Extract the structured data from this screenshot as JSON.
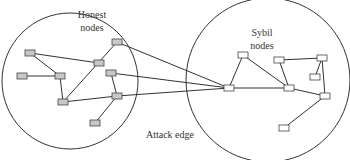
{
  "labels": {
    "honest_line1": "Honest",
    "honest_line2": "nodes",
    "sybil_line1": "Sybil",
    "sybil_line2": "nodes",
    "attack_edge": "Attack edge"
  },
  "colors": {
    "line": "#333333",
    "honest_node_fill": "#c8c8c8",
    "sybil_node_fill": "#ffffff"
  },
  "regions": {
    "honest": {
      "cx": 70,
      "cy": 81,
      "r": 68
    },
    "sybil": {
      "cx": 268,
      "cy": 80,
      "r": 82
    }
  },
  "honest_nodes": [
    {
      "id": "h1",
      "x": 30,
      "y": 53
    },
    {
      "id": "h2",
      "x": 22,
      "y": 76
    },
    {
      "id": "h3",
      "x": 60,
      "y": 76
    },
    {
      "id": "h4",
      "x": 63,
      "y": 102
    },
    {
      "id": "h5",
      "x": 99,
      "y": 63
    },
    {
      "id": "h6",
      "x": 117,
      "y": 42
    },
    {
      "id": "h7",
      "x": 111,
      "y": 73
    },
    {
      "id": "h8",
      "x": 117,
      "y": 96
    },
    {
      "id": "h9",
      "x": 95,
      "y": 123
    }
  ],
  "sybil_nodes": [
    {
      "id": "s1",
      "x": 229,
      "y": 88
    },
    {
      "id": "s2",
      "x": 243,
      "y": 55
    },
    {
      "id": "s3",
      "x": 289,
      "y": 88
    },
    {
      "id": "s4",
      "x": 279,
      "y": 60
    },
    {
      "id": "s5",
      "x": 322,
      "y": 58
    },
    {
      "id": "s6",
      "x": 315,
      "y": 77
    },
    {
      "id": "s7",
      "x": 325,
      "y": 96
    },
    {
      "id": "s8",
      "x": 284,
      "y": 128
    }
  ],
  "edges": [
    [
      "h1",
      "h3"
    ],
    [
      "h1",
      "h5"
    ],
    [
      "h2",
      "h3"
    ],
    [
      "h3",
      "h4"
    ],
    [
      "h4",
      "h6"
    ],
    [
      "h4",
      "h8"
    ],
    [
      "h7",
      "h8"
    ],
    [
      "h8",
      "h9"
    ],
    [
      "s1",
      "s2"
    ],
    [
      "s1",
      "s3"
    ],
    [
      "s2",
      "s3"
    ],
    [
      "s4",
      "s3"
    ],
    [
      "s4",
      "s5"
    ],
    [
      "s5",
      "s6"
    ],
    [
      "s5",
      "s7"
    ],
    [
      "s3",
      "s7"
    ],
    [
      "s7",
      "s8"
    ]
  ],
  "attack_edges": [
    [
      "h6",
      "s1"
    ],
    [
      "h7",
      "s1"
    ],
    [
      "h8",
      "s1"
    ]
  ]
}
